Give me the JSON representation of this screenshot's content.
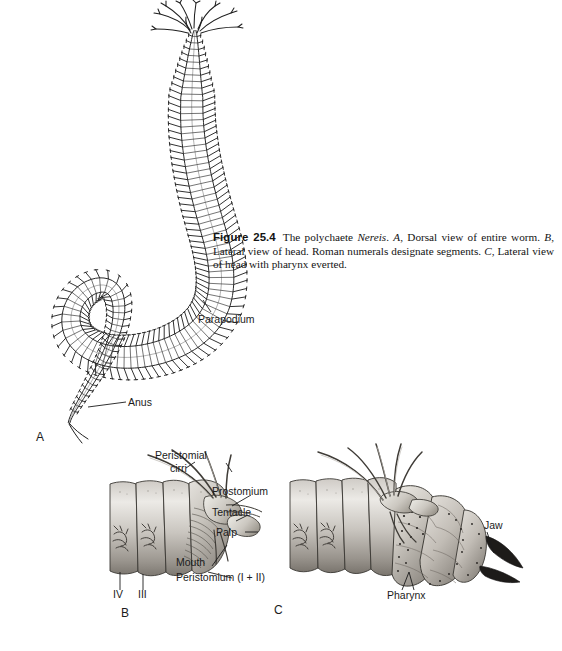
{
  "figure": {
    "number": "Figure 25.4",
    "caption_parts": {
      "p1": "The polychaete ",
      "genus": "Nereis",
      "p2": ". ",
      "a": "A",
      "p3": ", Dorsal view of entire worm. ",
      "b": "B",
      "p4": ", Lateral view of head. Roman numerals designate segments. ",
      "c": "C",
      "p5": ", Lateral view of head with pharynx everted."
    },
    "background_color": "#ffffff",
    "ink_color": "#1b1b1b"
  },
  "panel_a": {
    "letter": "A",
    "labels": {
      "parapodium": "Parapodium",
      "anus": "Anus"
    }
  },
  "panel_b": {
    "letter": "B",
    "labels": {
      "peristomial": "Peristomial",
      "cirri": "cirri",
      "prostomium": "Prostomium",
      "tentacle": "Tentacle",
      "palp": "Palp",
      "mouth": "Mouth",
      "peristomium": "Peristomium (I + II)",
      "segment_iv": "IV",
      "segment_iii": "III"
    }
  },
  "panel_c": {
    "letter": "C",
    "labels": {
      "jaw": "Jaw",
      "pharynx": "Pharynx"
    }
  }
}
